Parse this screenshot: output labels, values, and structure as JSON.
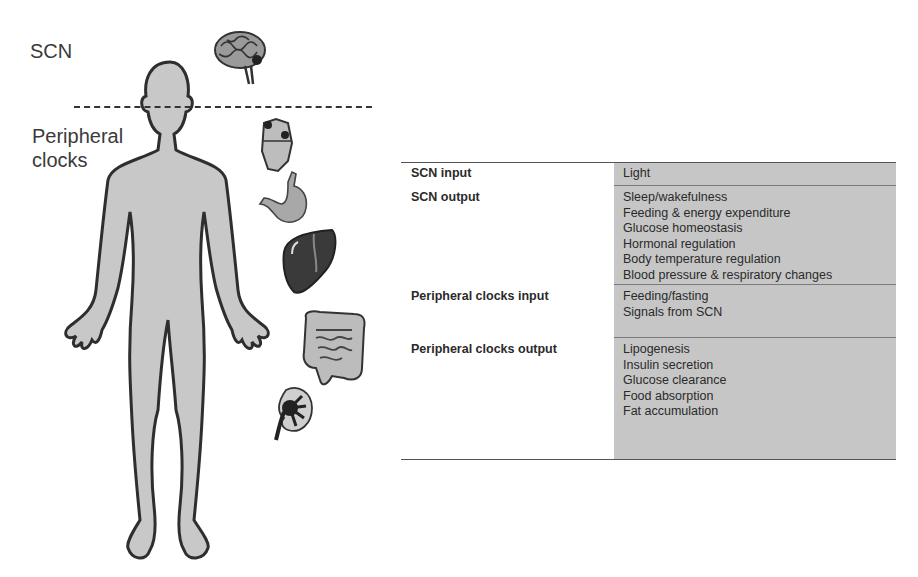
{
  "figure": {
    "labels": {
      "scn": "SCN",
      "peripheral_line1": "Peripheral",
      "peripheral_line2": "clocks"
    },
    "icons": [
      "human-body-silhouette",
      "brain-icon",
      "heart-icon",
      "stomach-icon",
      "liver-icon",
      "intestine-icon",
      "kidney-icon"
    ],
    "colors": {
      "body_fill": "#c8c8c8",
      "outline": "#2e2e2e",
      "table_shade": "#c6c6c6"
    }
  },
  "table": {
    "rows": [
      {
        "key": "SCN input",
        "values": [
          "Light"
        ]
      },
      {
        "key": "SCN output",
        "values": [
          "Sleep/wakefulness",
          "Feeding & energy expenditure",
          "Glucose homeostasis",
          "Hormonal regulation",
          "Body temperature regulation",
          "Blood pressure & respiratory changes"
        ]
      },
      {
        "key": "Peripheral clocks input",
        "values": [
          "Feeding/fasting",
          "Signals from SCN"
        ]
      },
      {
        "key": "Peripheral clocks output",
        "values": [
          "Lipogenesis",
          "Insulin secretion",
          "Glucose clearance",
          "Food absorption",
          "Fat accumulation"
        ]
      }
    ]
  }
}
